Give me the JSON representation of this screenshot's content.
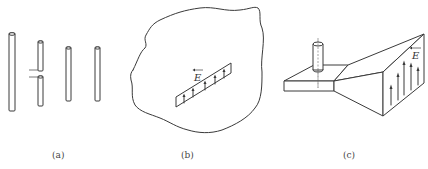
{
  "figure": {
    "panels": [
      {
        "id": "a",
        "caption": "(a)",
        "description": "wire antennas: straight wire, dipole with feed gap, two parallel wires"
      },
      {
        "id": "b",
        "caption": "(b)",
        "description": "aperture (slot) in a large conducting surface with field E across it"
      },
      {
        "id": "c",
        "caption": "(c)",
        "description": "horn antenna fed by a probe in a waveguide, with E-field arrows on the aperture"
      }
    ],
    "field_symbol": "E",
    "colors": {
      "line": "#3a3a3a",
      "background": "#ffffff"
    }
  }
}
